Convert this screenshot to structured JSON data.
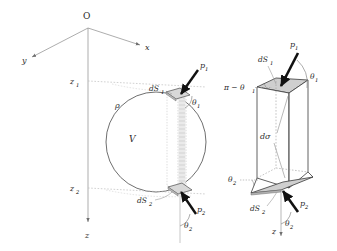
{
  "figure": {
    "title_alt": "Sphere with elementary vertical column and magnified prism",
    "background_color": "#ffffff",
    "line_color": "#3a3a3a",
    "dotted_color": "#b9b9b9",
    "shade_color": "#d2d2d2",
    "arrow_color": "#111111"
  },
  "axes": {
    "origin_label": "O",
    "x_label": "x",
    "y_label": "y",
    "z_label": "z",
    "z_label_right": "z"
  },
  "left_figure": {
    "volume_label": "V",
    "boundary_label": "ρ",
    "height_top_label": "z",
    "height_top_sub": "1",
    "height_bottom_label": "z",
    "height_bottom_sub": "2",
    "top_element_label": "dS",
    "top_element_sub": "1",
    "bottom_element_label": "dS",
    "bottom_element_sub": "2",
    "top_pressure_label": "p",
    "top_pressure_sub": "1",
    "bottom_pressure_label": "p",
    "bottom_pressure_sub": "2",
    "top_angle_label": "θ",
    "top_angle_sub": "1",
    "bottom_angle_label": "θ",
    "bottom_angle_sub": "2"
  },
  "right_figure": {
    "top_element_label": "dS",
    "top_element_sub": "1",
    "bottom_element_label": "dS",
    "bottom_element_sub": "2",
    "cross_section_label": "dσ",
    "supplement_angle_label": "π − θ",
    "supplement_angle_sub": "1",
    "top_angle_label": "θ",
    "top_angle_sub": "1",
    "bottom_angle_label": "θ",
    "bottom_angle_sub": "2",
    "bottom_angle_label2": "θ",
    "bottom_angle_sub2": "2",
    "top_pressure_label": "p",
    "top_pressure_sub": "1",
    "bottom_pressure_label": "p",
    "bottom_pressure_sub": "2"
  }
}
